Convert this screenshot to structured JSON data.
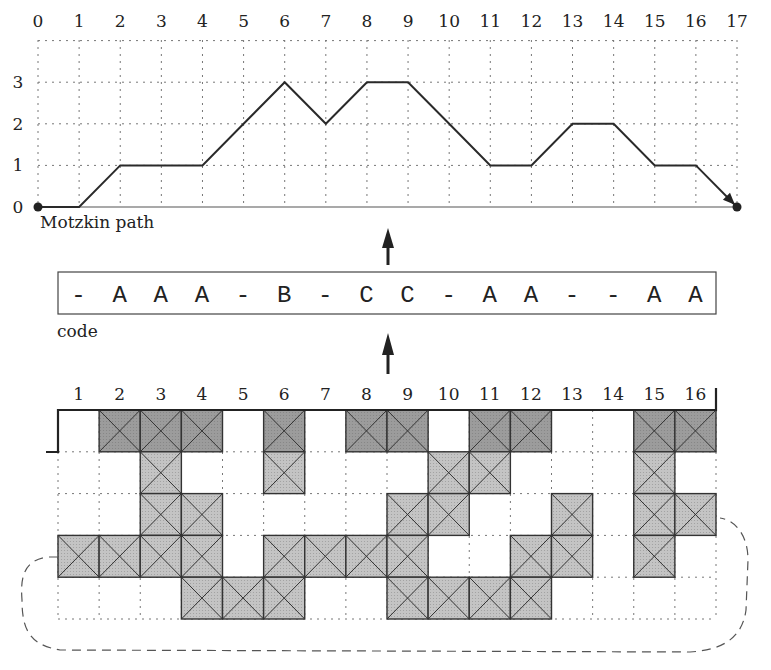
{
  "top_chart": {
    "caption": "Motzkin path",
    "x_ticks": [
      "0",
      "1",
      "2",
      "3",
      "4",
      "5",
      "6",
      "7",
      "8",
      "9",
      "10",
      "11",
      "12",
      "13",
      "14",
      "15",
      "16",
      "17"
    ],
    "y_ticks": [
      "0",
      "1",
      "2",
      "3"
    ],
    "path_heights": [
      0,
      0,
      1,
      1,
      1,
      2,
      3,
      2,
      3,
      3,
      2,
      1,
      1,
      2,
      2,
      1,
      1,
      0
    ],
    "line_color": "#2a2a2a",
    "grid_color": "#777777"
  },
  "code": {
    "caption": "code",
    "symbols": [
      "-",
      "A",
      "A",
      "A",
      "-",
      "B",
      "-",
      "C",
      "C",
      "-",
      "A",
      "A",
      "-",
      "-",
      "A",
      "A"
    ]
  },
  "bottom_grid": {
    "col_labels": [
      "1",
      "2",
      "3",
      "4",
      "5",
      "6",
      "7",
      "8",
      "9",
      "10",
      "11",
      "12",
      "13",
      "14",
      "15",
      "16"
    ],
    "rows": [
      {
        "row": 0,
        "shade": "dark",
        "cols": [
          2,
          3,
          4,
          6,
          8,
          9,
          11,
          12,
          15,
          16
        ]
      },
      {
        "row": 1,
        "shade": "light",
        "cols": [
          3,
          6,
          10,
          11,
          15
        ]
      },
      {
        "row": 2,
        "shade": "light",
        "cols": [
          3,
          4,
          9,
          10,
          13,
          15,
          16
        ]
      },
      {
        "row": 3,
        "shade": "light",
        "cols": [
          1,
          2,
          3,
          4,
          6,
          7,
          8,
          9,
          12,
          13,
          15
        ]
      },
      {
        "row": 4,
        "shade": "light",
        "cols": [
          4,
          5,
          6,
          9,
          10,
          11,
          12
        ]
      }
    ],
    "dark_fill": "#9c9c9c",
    "light_fill": "#c4c4c4"
  },
  "arrows": [
    {
      "from": "bottom_grid",
      "to": "code"
    },
    {
      "from": "code",
      "to": "top_chart"
    }
  ]
}
